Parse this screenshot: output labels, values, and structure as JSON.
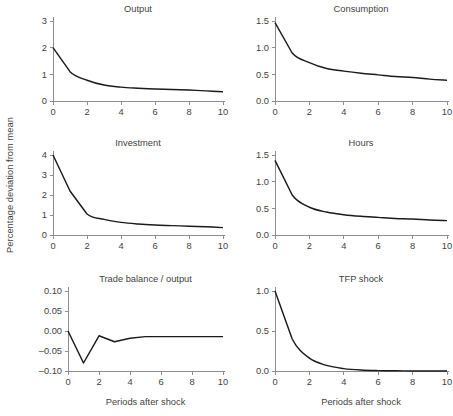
{
  "figure": {
    "shared_ylabel": "Percentage deviation from mean",
    "axis_color": "#8d8d8d",
    "line_color": "#1b1b1b",
    "text_color": "#3f3f3f",
    "background": "#ffffff"
  },
  "chart_data": [
    {
      "type": "line",
      "title": "Output",
      "xlabel": "",
      "ylabel": "",
      "x": [
        0,
        1,
        2,
        3,
        4,
        5,
        6,
        7,
        8,
        9,
        10
      ],
      "values": [
        2.0,
        1.1,
        0.78,
        0.6,
        0.52,
        0.48,
        0.45,
        0.43,
        0.41,
        0.38,
        0.35
      ],
      "xlim": [
        0,
        10
      ],
      "ylim": [
        0,
        3
      ],
      "xticks": [
        0,
        2,
        4,
        6,
        8,
        10
      ],
      "xticklabels": [
        "0",
        "2",
        "4",
        "6",
        "8",
        "10"
      ],
      "yticks": [
        0,
        1,
        2,
        3
      ],
      "yticklabels": [
        "0",
        "1",
        "2",
        "3"
      ],
      "grid": false,
      "legend": false
    },
    {
      "type": "line",
      "title": "Consumption",
      "xlabel": "",
      "ylabel": "",
      "x": [
        0,
        1,
        2,
        3,
        4,
        5,
        6,
        7,
        8,
        9,
        10
      ],
      "values": [
        1.47,
        0.9,
        0.72,
        0.61,
        0.56,
        0.52,
        0.49,
        0.46,
        0.44,
        0.41,
        0.39
      ],
      "xlim": [
        0,
        10
      ],
      "ylim": [
        0.0,
        1.5
      ],
      "xticks": [
        0,
        2,
        4,
        6,
        8,
        10
      ],
      "xticklabels": [
        "0",
        "2",
        "4",
        "6",
        "8",
        "10"
      ],
      "yticks": [
        0.0,
        0.5,
        1.0,
        1.5
      ],
      "yticklabels": [
        "0.0",
        "0.5",
        "1.0",
        "1.5"
      ],
      "grid": false,
      "legend": false
    },
    {
      "type": "line",
      "title": "Investment",
      "xlabel": "",
      "ylabel": "",
      "x": [
        0,
        1,
        2,
        3,
        4,
        5,
        6,
        7,
        8,
        9,
        10
      ],
      "values": [
        4.0,
        2.2,
        1.05,
        0.78,
        0.63,
        0.55,
        0.5,
        0.47,
        0.44,
        0.41,
        0.37
      ],
      "xlim": [
        0,
        10
      ],
      "ylim": [
        0,
        4
      ],
      "xticks": [
        0,
        2,
        4,
        6,
        8,
        10
      ],
      "xticklabels": [
        "0",
        "2",
        "4",
        "6",
        "8",
        "10"
      ],
      "yticks": [
        0,
        1,
        2,
        3,
        4
      ],
      "yticklabels": [
        "0",
        "1",
        "2",
        "3",
        "4"
      ],
      "grid": false,
      "legend": false
    },
    {
      "type": "line",
      "title": "Hours",
      "xlabel": "",
      "ylabel": "",
      "x": [
        0,
        1,
        2,
        3,
        4,
        5,
        6,
        7,
        8,
        9,
        10
      ],
      "values": [
        1.4,
        0.75,
        0.52,
        0.43,
        0.38,
        0.35,
        0.33,
        0.31,
        0.3,
        0.28,
        0.27
      ],
      "xlim": [
        0,
        10
      ],
      "ylim": [
        0.0,
        1.5
      ],
      "xticks": [
        0,
        2,
        4,
        6,
        8,
        10
      ],
      "xticklabels": [
        "0",
        "2",
        "4",
        "6",
        "8",
        "10"
      ],
      "yticks": [
        0.0,
        0.5,
        1.0,
        1.5
      ],
      "yticklabels": [
        "0.0",
        "0.5",
        "1.0",
        "1.5"
      ],
      "grid": false,
      "legend": false
    },
    {
      "type": "line",
      "title": "Trade balance / output",
      "xlabel": "Periods after shock",
      "ylabel": "",
      "x": [
        0,
        1,
        2,
        3,
        4,
        5,
        6,
        7,
        8,
        9,
        10
      ],
      "values": [
        0.0,
        -0.08,
        -0.012,
        -0.027,
        -0.018,
        -0.014,
        -0.014,
        -0.014,
        -0.014,
        -0.014,
        -0.014
      ],
      "xlim": [
        0,
        10
      ],
      "ylim": [
        -0.1,
        0.1
      ],
      "xticks": [
        0,
        2,
        4,
        6,
        8,
        10
      ],
      "xticklabels": [
        "0",
        "2",
        "4",
        "6",
        "8",
        "10"
      ],
      "yticks": [
        0.1,
        0.05,
        0.0,
        -0.05,
        -0.1
      ],
      "yticklabels": [
        "0.10",
        "0.05",
        "0.00",
        "–0.05",
        "–0.10"
      ],
      "grid": false,
      "legend": false
    },
    {
      "type": "line",
      "title": "TFP shock",
      "xlabel": "Periods after shock",
      "ylabel": "",
      "x": [
        0,
        1,
        2,
        3,
        4,
        5,
        6,
        7,
        8,
        9,
        10
      ],
      "values": [
        1.0,
        0.4,
        0.16,
        0.07,
        0.03,
        0.012,
        0.005,
        0.002,
        0.001,
        0.0,
        0.0
      ],
      "xlim": [
        0,
        10
      ],
      "ylim": [
        0.0,
        1.0
      ],
      "xticks": [
        0,
        2,
        4,
        6,
        8,
        10
      ],
      "xticklabels": [
        "0",
        "2",
        "4",
        "6",
        "8",
        "10"
      ],
      "yticks": [
        0.0,
        0.5,
        1.0
      ],
      "yticklabels": [
        "0.0",
        "0.5",
        "1.0"
      ],
      "grid": false,
      "legend": false
    }
  ]
}
